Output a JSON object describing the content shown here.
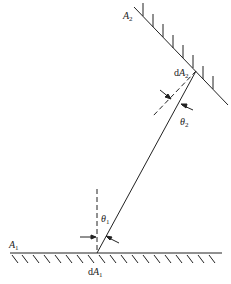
{
  "diagram": {
    "type": "radiative view factor geometry between two differential surfaces",
    "colors": {
      "line": "#222222",
      "background": "#ffffff"
    },
    "labels": {
      "A1": {
        "prefix": "",
        "main": "A",
        "sub": "1"
      },
      "A2": {
        "prefix": "",
        "main": "A",
        "sub": "2"
      },
      "dA1": {
        "prefix": "d",
        "main": "A",
        "sub": "1"
      },
      "dA2": {
        "prefix": "d",
        "main": "A",
        "sub": "2"
      },
      "theta1": {
        "prefix": "",
        "main": "θ",
        "sub": "1"
      },
      "theta2": {
        "prefix": "",
        "main": "θ",
        "sub": "2"
      }
    },
    "elements": [
      "surface A1 (horizontal, hatched below)",
      "surface A2 (inclined, hatched above)",
      "ray connecting dA1 and dA2",
      "dashed normal at dA1",
      "dashed normal at dA2",
      "angle θ1 between normal and ray at dA1",
      "angle θ2 between normal and ray at dA2"
    ]
  }
}
